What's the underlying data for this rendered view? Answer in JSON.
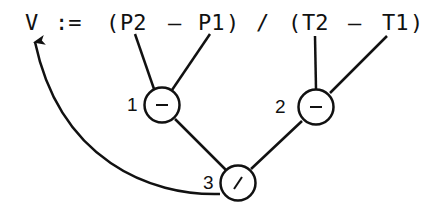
{
  "expression": {
    "full": "V := (P2 - P1) / (T2 - T1)",
    "tokens": {
      "target": "V",
      "assign": ":=",
      "lparen1": "(",
      "p2": "P2",
      "minus1": "–",
      "p1": "P1",
      "rparen1": ")",
      "divide": "/",
      "lparen2": "(",
      "t2": "T2",
      "minus2": "–",
      "t1": "T1",
      "rparen2": ")"
    }
  },
  "nodes": [
    {
      "id": "1",
      "label": "1",
      "operator": "–",
      "operands": [
        "P2",
        "P1"
      ]
    },
    {
      "id": "2",
      "label": "2",
      "operator": "–",
      "operands": [
        "T2",
        "T1"
      ]
    },
    {
      "id": "3",
      "label": "3",
      "operator": "/",
      "operands": [
        "1",
        "2"
      ],
      "result_to": "V"
    }
  ],
  "colors": {
    "stroke": "#111111",
    "background": "#ffffff"
  }
}
